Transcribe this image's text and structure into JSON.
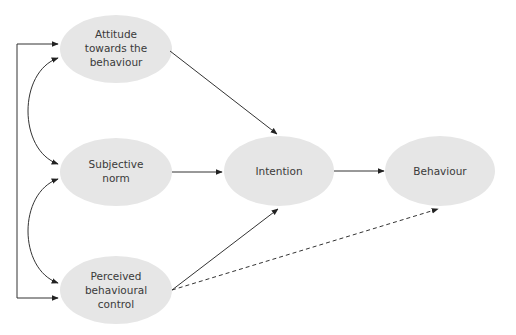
{
  "diagram": {
    "title": "",
    "nodes": [
      {
        "id": "attitude",
        "lines": [
          "Attitude",
          "towards the",
          "behaviour"
        ],
        "cx": 116,
        "cy": 49,
        "rx": 56,
        "ry": 34
      },
      {
        "id": "subjective_norm",
        "lines": [
          "Subjective",
          "norm"
        ],
        "cx": 116,
        "cy": 172,
        "rx": 56,
        "ry": 34
      },
      {
        "id": "perceived_control",
        "lines": [
          "Perceived",
          "behavioural",
          "control"
        ],
        "cx": 116,
        "cy": 290,
        "rx": 56,
        "ry": 34
      },
      {
        "id": "intention",
        "lines": [
          "Intention"
        ],
        "cx": 279,
        "cy": 171,
        "rx": 55,
        "ry": 35
      },
      {
        "id": "behaviour",
        "lines": [
          "Behaviour"
        ],
        "cx": 440,
        "cy": 171,
        "rx": 55,
        "ry": 35
      }
    ],
    "edges": [
      {
        "from": "attitude",
        "to": "intention",
        "style": "solid"
      },
      {
        "from": "subjective_norm",
        "to": "intention",
        "style": "solid"
      },
      {
        "from": "perceived_control",
        "to": "intention",
        "style": "solid"
      },
      {
        "from": "intention",
        "to": "behaviour",
        "style": "solid"
      },
      {
        "from": "perceived_control",
        "to": "behaviour",
        "style": "dashed"
      },
      {
        "from": "attitude",
        "to": "subjective_norm",
        "style": "curved-bidirectional"
      },
      {
        "from": "subjective_norm",
        "to": "perceived_control",
        "style": "curved-bidirectional"
      },
      {
        "from": "attitude",
        "to": "perceived_control",
        "style": "bracket-bidirectional"
      }
    ],
    "colors": {
      "node_fill": "#e6e6e6",
      "text": "#3a3a3a",
      "line": "#333333"
    }
  }
}
